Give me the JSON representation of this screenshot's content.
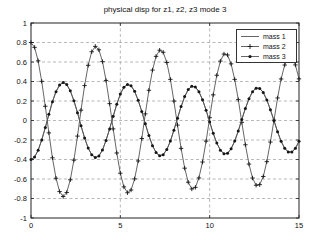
{
  "title": "physical disp for z1, z2, z3 mode 3",
  "axes": {
    "x_ticks": [
      "0",
      "5",
      "10",
      "15"
    ],
    "y_ticks": [
      "1",
      "0.8",
      "0.6",
      "0.4",
      "0.2",
      "0",
      "-0.2",
      "-0.4",
      "-0.6",
      "-0.8",
      "-1"
    ],
    "x_grid": [
      5,
      10
    ],
    "y_grid": [
      -0.8,
      -0.6,
      -0.4,
      -0.2,
      0,
      0.2,
      0.4,
      0.6,
      0.8
    ]
  },
  "legend": {
    "entries": [
      {
        "label": "mass 1",
        "marker": "none"
      },
      {
        "label": "mass 2",
        "marker": "plus"
      },
      {
        "label": "mass 3",
        "marker": "dot"
      }
    ]
  },
  "colors": {
    "line": "#555555",
    "marker": "#161616",
    "grid": "#9a9a9a",
    "axis": "#222222",
    "text": "#111111",
    "bg": "#ffffff"
  },
  "chart_data": {
    "type": "line",
    "title": "physical disp for z1, z2, z3 mode 3",
    "xlabel": "",
    "ylabel": "",
    "xlim": [
      0,
      15
    ],
    "ylim": [
      -1,
      1
    ],
    "grid": true,
    "legend_position": "top-right",
    "x": [
      0,
      0.2,
      0.4,
      0.6,
      0.8,
      1,
      1.2,
      1.4,
      1.6,
      1.8,
      2,
      2.2,
      2.4,
      2.6,
      2.8,
      3,
      3.2,
      3.4,
      3.6,
      3.8,
      4,
      4.2,
      4.4,
      4.6,
      4.8,
      5,
      5.2,
      5.4,
      5.6,
      5.8,
      6,
      6.2,
      6.4,
      6.6,
      6.8,
      7,
      7.2,
      7.4,
      7.6,
      7.8,
      8,
      8.2,
      8.4,
      8.6,
      8.8,
      9,
      9.2,
      9.4,
      9.6,
      9.8,
      10,
      10.2,
      10.4,
      10.6,
      10.8,
      11,
      11.2,
      11.4,
      11.6,
      11.8,
      12,
      12.2,
      12.4,
      12.6,
      12.8,
      13,
      13.2,
      13.4,
      13.6,
      13.8,
      14,
      14.2,
      14.4,
      14.6,
      14.8,
      15
    ],
    "series": [
      {
        "name": "mass 1",
        "line": "solid",
        "marker": "none",
        "values": [
          -0.4,
          -0.375,
          -0.306,
          -0.201,
          -0.073,
          0.063,
          0.192,
          0.296,
          0.365,
          0.39,
          0.369,
          0.304,
          0.203,
          0.08,
          -0.053,
          -0.179,
          -0.283,
          -0.352,
          -0.38,
          -0.363,
          -0.302,
          -0.205,
          -0.086,
          0.043,
          0.167,
          0.271,
          0.34,
          0.37,
          0.356,
          0.3,
          0.207,
          0.092,
          -0.034,
          -0.155,
          -0.258,
          -0.329,
          -0.361,
          -0.35,
          -0.298,
          -0.211,
          -0.099,
          0.024,
          0.143,
          0.245,
          0.317,
          0.351,
          0.343,
          0.295,
          0.213,
          0.106,
          -0.014,
          -0.132,
          -0.232,
          -0.305,
          -0.341,
          -0.336,
          -0.29,
          -0.211,
          -0.107,
          0.01,
          0.124,
          0.223,
          0.295,
          0.332,
          0.329,
          0.287,
          0.211,
          0.111,
          -0.002,
          -0.116,
          -0.213,
          -0.285,
          -0.323,
          -0.323,
          -0.285,
          -0.214
        ]
      },
      {
        "name": "mass 2",
        "line": "solid",
        "marker": "plus",
        "values": [
          0.8,
          0.75,
          0.612,
          0.402,
          0.146,
          -0.127,
          -0.383,
          -0.592,
          -0.729,
          -0.78,
          -0.738,
          -0.608,
          -0.407,
          -0.16,
          0.106,
          0.358,
          0.566,
          0.705,
          0.76,
          0.725,
          0.604,
          0.411,
          0.173,
          -0.086,
          -0.333,
          -0.541,
          -0.681,
          -0.741,
          -0.713,
          -0.599,
          -0.415,
          -0.185,
          0.068,
          0.31,
          0.517,
          0.658,
          0.721,
          0.7,
          0.595,
          0.422,
          0.199,
          -0.047,
          -0.286,
          -0.489,
          -0.633,
          -0.702,
          -0.686,
          -0.589,
          -0.426,
          -0.212,
          0.029,
          0.263,
          0.464,
          0.609,
          0.682,
          0.672,
          0.581,
          0.422,
          0.214,
          -0.019,
          -0.249,
          -0.447,
          -0.59,
          -0.664,
          -0.658,
          -0.574,
          -0.422,
          -0.221,
          0.004,
          0.231,
          0.426,
          0.569,
          0.645,
          0.646,
          0.57,
          0.427
        ]
      },
      {
        "name": "mass 3",
        "line": "solid",
        "marker": "dot",
        "values": [
          -0.4,
          -0.375,
          -0.306,
          -0.201,
          -0.073,
          0.063,
          0.192,
          0.296,
          0.365,
          0.39,
          0.369,
          0.304,
          0.203,
          0.08,
          -0.053,
          -0.179,
          -0.283,
          -0.352,
          -0.38,
          -0.363,
          -0.302,
          -0.205,
          -0.086,
          0.043,
          0.167,
          0.271,
          0.34,
          0.37,
          0.356,
          0.3,
          0.207,
          0.092,
          -0.034,
          -0.155,
          -0.258,
          -0.329,
          -0.361,
          -0.35,
          -0.298,
          -0.211,
          -0.099,
          0.024,
          0.143,
          0.245,
          0.317,
          0.351,
          0.343,
          0.295,
          0.213,
          0.106,
          -0.014,
          -0.132,
          -0.232,
          -0.305,
          -0.341,
          -0.336,
          -0.29,
          -0.211,
          -0.107,
          0.01,
          0.124,
          0.223,
          0.295,
          0.332,
          0.329,
          0.287,
          0.211,
          0.111,
          -0.002,
          -0.116,
          -0.213,
          -0.285,
          -0.323,
          -0.323,
          -0.285,
          -0.214
        ]
      }
    ]
  }
}
